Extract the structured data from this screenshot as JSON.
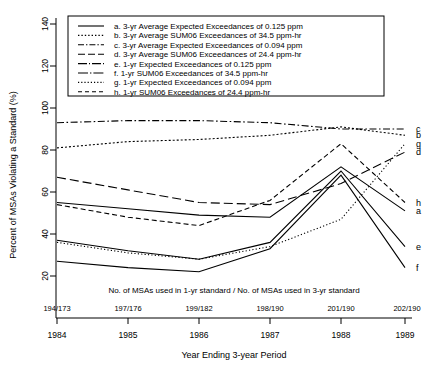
{
  "chart_data": {
    "type": "line",
    "title": "",
    "xlabel": "Year Ending 3-year Period",
    "ylabel": "Percent of MSAs Violating a Standard (%)",
    "categories": [
      "1984",
      "1985",
      "1986",
      "1987",
      "1988",
      "1989"
    ],
    "ylim": [
      20,
      140
    ],
    "yticks": [
      20,
      40,
      60,
      80,
      100,
      120,
      140
    ],
    "grid": false,
    "legend_position": "top-inside",
    "annotation": "No. of MSAs used in 1-yr standard / No. of MSAs used in 3-yr standard",
    "secondary_xtick_labels": [
      "194/173",
      "197/176",
      "199/182",
      "198/190",
      "201/190",
      "202/190"
    ],
    "series": [
      {
        "key": "a",
        "name": "3-yr Average Expected Exceedances of 0.125 ppm",
        "style": "solid",
        "end_label": "a",
        "values": [
          55,
          52,
          49,
          48,
          72,
          51
        ]
      },
      {
        "key": "b",
        "name": "3-yr Average SUM06 Exceedances of 34.5 ppm-hr",
        "style": "dotted",
        "end_label": "b",
        "values": [
          81,
          84,
          85,
          87,
          91,
          87
        ]
      },
      {
        "key": "c",
        "name": "3-yr Average Expected Exceedances of 0.094 ppm",
        "style": "dashdot",
        "end_label": "c",
        "values": [
          93,
          94,
          94,
          93,
          90,
          90
        ]
      },
      {
        "key": "d",
        "name": "3-yr Average SUM06 Exceedances of 24.4 ppm-hr",
        "style": "longdash",
        "end_label": "d",
        "values": [
          67,
          61,
          55,
          54,
          64,
          79
        ]
      },
      {
        "key": "e",
        "name": "1-yr Expected Exceedances of 0.125 ppm",
        "style": "solid-thin",
        "end_label": "e",
        "values": [
          37,
          32,
          28,
          36,
          70,
          34
        ]
      },
      {
        "key": "f",
        "name": "1-yr SUM06 Exceedances of 34.5 ppm-hr",
        "style": "solid-thin2",
        "end_label": "f",
        "values": [
          27,
          24,
          22,
          33,
          68,
          24
        ]
      },
      {
        "key": "g",
        "name": "1-yr Expected Exceedances of 0.094 ppm",
        "style": "fine-dotted",
        "end_label": "g",
        "values": [
          36,
          31,
          28,
          34,
          47,
          83
        ]
      },
      {
        "key": "h",
        "name": "1-yr SUM06 Exceedances of 24.4 ppm-hr",
        "style": "dashed",
        "end_label": "h",
        "values": [
          54,
          48,
          44,
          56,
          83,
          55
        ]
      }
    ]
  },
  "axis": {
    "y_title": "Percent of MSAs Violating a Standard (%)",
    "x_title": "Year Ending 3-year Period",
    "y_ticks": [
      "20",
      "40",
      "60",
      "80",
      "100",
      "120",
      "140"
    ],
    "x_ticks": [
      "1984",
      "1985",
      "1986",
      "1987",
      "1988",
      "1989"
    ],
    "ratios": [
      "194/173",
      "197/176",
      "199/182",
      "198/190",
      "201/190",
      "202/190"
    ]
  },
  "note": {
    "text": "No. of MSAs used in 1-yr standard / No. of MSAs used in 3-yr standard"
  },
  "legend": {
    "entries": [
      "a. 3-yr Average Expected Exceedances of 0.125 ppm",
      "b. 3-yr Average SUM06 Exceedances of 34.5 ppm-hr",
      "c. 3-yr Average Expected Exceedances of 0.094 ppm",
      "d. 3-yr Average SUM06 Exceedances of 24.4 ppm-hr",
      "e. 1-yr Expected Exceedances of 0.125 ppm",
      "f. 1-yr SUM06 Exceedances of 34.5 ppm-hr",
      "g. 1-yr Expected Exceedances of 0.094 ppm",
      "h. 1-yr SUM06 Exceedances of 24.4 ppm-hr"
    ]
  },
  "curve_end_labels": [
    "c",
    "g",
    "d",
    "a",
    "b",
    "h",
    "e",
    "f"
  ],
  "colors": {
    "line": "#000000",
    "background": "#ffffff"
  }
}
